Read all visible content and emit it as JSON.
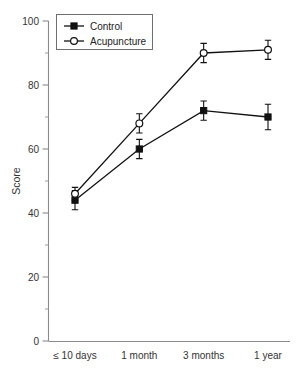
{
  "chart_data": {
    "type": "line",
    "title": "",
    "xlabel": "",
    "ylabel": "Score",
    "categories": [
      "≤ 10 days",
      "1 month",
      "3 months",
      "1 year"
    ],
    "ylim": [
      0,
      100
    ],
    "yticks": [
      0,
      20,
      40,
      60,
      80,
      100
    ],
    "ytick_labels": [
      "0",
      "20",
      "40",
      "60",
      "80",
      "100"
    ],
    "yminor_ticks": [
      10,
      30,
      50,
      70,
      90
    ],
    "grid": false,
    "legend_position": "top-left",
    "series": [
      {
        "name": "Control",
        "marker": "filled-square",
        "values": [
          44,
          60,
          72,
          70
        ],
        "errors": [
          3,
          3,
          3,
          4
        ]
      },
      {
        "name": "Acupuncture",
        "marker": "open-circle",
        "values": [
          46,
          68,
          90,
          91
        ],
        "errors": [
          2,
          3,
          3,
          3
        ]
      }
    ]
  },
  "legend": {
    "entries": [
      {
        "label": "Control"
      },
      {
        "label": "Acupuncture"
      }
    ]
  },
  "axes": {
    "y_title": "Score"
  },
  "colors": {
    "ink": "#111111",
    "axis": "#8a8a8a",
    "background": "#ffffff"
  }
}
